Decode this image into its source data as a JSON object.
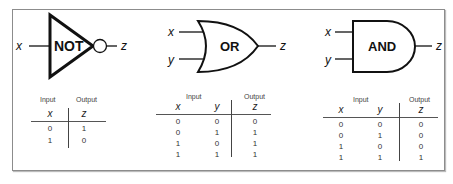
{
  "gates": [
    {
      "name": "NOT",
      "label": "NOT",
      "inputs": [
        "x"
      ],
      "output": "z",
      "truth_table": {
        "group_headers": {
          "input": "Input",
          "output": "Output"
        },
        "columns": [
          "x",
          "z"
        ],
        "rows": [
          [
            "0",
            "1"
          ],
          [
            "1",
            "0"
          ]
        ]
      }
    },
    {
      "name": "OR",
      "label": "OR",
      "inputs": [
        "x",
        "y"
      ],
      "output": "z",
      "truth_table": {
        "group_headers": {
          "input": "Input",
          "output": "Output"
        },
        "columns": [
          "x",
          "y",
          "z"
        ],
        "rows": [
          [
            "0",
            "0",
            "0"
          ],
          [
            "0",
            "1",
            "1"
          ],
          [
            "1",
            "0",
            "1"
          ],
          [
            "1",
            "1",
            "1"
          ]
        ]
      }
    },
    {
      "name": "AND",
      "label": "AND",
      "inputs": [
        "x",
        "y"
      ],
      "output": "z",
      "truth_table": {
        "group_headers": {
          "input": "Input",
          "output": "Output"
        },
        "columns": [
          "x",
          "y",
          "z"
        ],
        "rows": [
          [
            "0",
            "0",
            "0"
          ],
          [
            "0",
            "1",
            "0"
          ],
          [
            "1",
            "0",
            "0"
          ],
          [
            "1",
            "1",
            "1"
          ]
        ]
      }
    }
  ],
  "colors": {
    "stroke": "#111111",
    "frame": "#8c8c8c",
    "text": "#333333"
  }
}
